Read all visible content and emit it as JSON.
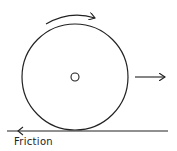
{
  "diagram": {
    "labels": {
      "friction": "Friction"
    },
    "elements": {
      "wheel": {
        "cx": 75,
        "cy": 77,
        "r": 53
      },
      "axle": {
        "cx": 75,
        "cy": 77,
        "r": 4
      },
      "ground": {
        "x1": 7,
        "x2": 168,
        "y": 131
      },
      "rotation_arrow": "clockwise",
      "velocity_arrow": "right",
      "friction_arrow": "left"
    },
    "colors": {
      "stroke": "#222222",
      "background": "#ffffff"
    }
  }
}
